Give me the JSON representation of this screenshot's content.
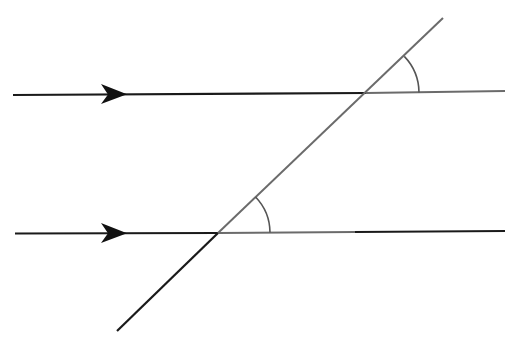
{
  "diagram": {
    "colors": {
      "dark_line": "#1a1a1a",
      "gray_line": "#6b6b6b",
      "arc": "#555555",
      "background": "#ffffff"
    },
    "parallel_lines": [
      {
        "name": "upper-parallel-line",
        "x1": 13,
        "y1": 95,
        "x2": 505,
        "y2": 91,
        "arrow_x": 125,
        "intersection": [
          366,
          93
        ],
        "gray_from": 366
      },
      {
        "name": "lower-parallel-line",
        "x1": 15,
        "y1": 233,
        "x2": 505,
        "y2": 231,
        "arrow_x": 125,
        "intersection": [
          218,
          233
        ],
        "gray_from": 218,
        "gray_to": 355
      }
    ],
    "transversal": {
      "x1": 117,
      "y1": 331,
      "x2": 443,
      "y2": 18
    },
    "angle_arcs": [
      {
        "name": "upper-angle-arc",
        "cx": 366,
        "cy": 93,
        "r": 53
      },
      {
        "name": "lower-angle-arc",
        "cx": 218,
        "cy": 233,
        "r": 52
      }
    ]
  }
}
